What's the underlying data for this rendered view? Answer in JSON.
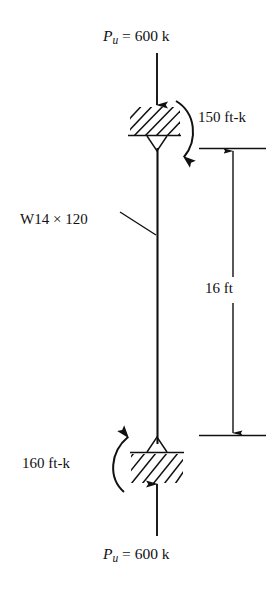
{
  "figure": {
    "type": "structural-column-free-body-diagram",
    "stroke_color": "#111111",
    "background_color": "#ffffff"
  },
  "labels": {
    "top_load": {
      "symbol": "P",
      "subscript": "u",
      "equals": "=",
      "value": "600",
      "unit": "k",
      "full": "P_u = 600 k"
    },
    "bottom_load": {
      "symbol": "P",
      "subscript": "u",
      "equals": "=",
      "value": "600",
      "unit": "k",
      "full": "P_u = 600 k"
    },
    "top_moment": {
      "value": "150",
      "unit": "ft-k",
      "full": "150 ft-k"
    },
    "bottom_moment": {
      "value": "160",
      "unit": "ft-k",
      "full": "160 ft-k"
    },
    "member": {
      "designation": "W14",
      "times": "×",
      "weight": "120",
      "full": "W14 × 120"
    },
    "dimension": {
      "value": "16",
      "unit": "ft",
      "full": "16 ft"
    }
  },
  "geometry": {
    "column_x": 157,
    "column_top_y": 146,
    "column_bottom_y": 444,
    "top_support_y": 136,
    "bottom_support_y": 453,
    "dimension_line_x": 233,
    "dimension_top_y": 148,
    "dimension_bottom_y": 435
  }
}
